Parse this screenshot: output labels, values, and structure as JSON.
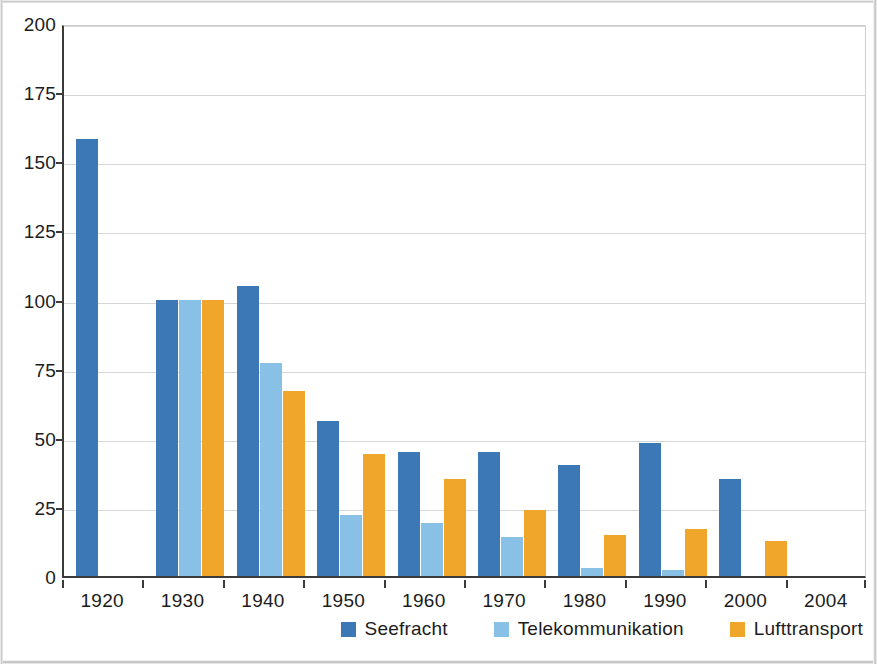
{
  "chart_data": {
    "type": "bar",
    "title": "",
    "subtitle": "",
    "xlabel": "",
    "ylabel": "",
    "categories": [
      "1920",
      "1930",
      "1940",
      "1950",
      "1960",
      "1970",
      "1980",
      "1990",
      "2000",
      "2004"
    ],
    "series": [
      {
        "name": "Seefracht",
        "color": "#3b78b5",
        "values": [
          158,
          100,
          105,
          56,
          45,
          45,
          40,
          48,
          35,
          null
        ]
      },
      {
        "name": "Telekommunikation",
        "color": "#88c0e6",
        "values": [
          null,
          100,
          77,
          22,
          19,
          14,
          3,
          2,
          null,
          null
        ]
      },
      {
        "name": "Lufttransport",
        "color": "#f0a62b",
        "values": [
          null,
          100,
          67,
          44,
          35,
          24,
          15,
          17,
          12.5,
          null
        ]
      }
    ],
    "ylim": [
      0,
      200
    ],
    "yticks": [
      0,
      25,
      50,
      75,
      100,
      125,
      150,
      175,
      200
    ],
    "ytick_labels": [
      "0",
      "25",
      "50",
      "75",
      "100",
      "125",
      "150",
      "175",
      "200"
    ],
    "xtick_labels": [
      "1920",
      "1930",
      "1940",
      "1950",
      "1960",
      "1970",
      "1980",
      "1990",
      "2000",
      "2004"
    ],
    "grid": true,
    "legend_position": "bottom-right",
    "legend_entries": [
      "Seefracht",
      "Telekommunikation",
      "Lufttransport"
    ]
  },
  "legend": {
    "items": [
      {
        "label": "Seefracht",
        "color": "#3b78b5"
      },
      {
        "label": "Telekommunikation",
        "color": "#88c0e6"
      },
      {
        "label": "Lufttransport",
        "color": "#f0a62b"
      }
    ]
  },
  "colors": {
    "series_seefracht": "#3b78b5",
    "series_telekommunikation": "#88c0e6",
    "series_lufttransport": "#f0a62b",
    "gridline": "#d6d6d6",
    "axis": "#3a3a3a",
    "text": "#1c1c1c",
    "background": "#ffffff"
  }
}
